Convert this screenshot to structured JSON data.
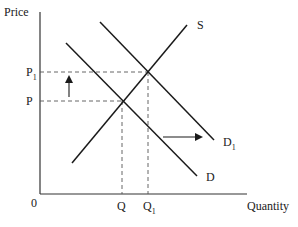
{
  "diagram": {
    "type": "supply-demand",
    "axes": {
      "y_label": "Price",
      "x_label": "Quantity",
      "origin_label": "0"
    },
    "price_levels": {
      "p": {
        "main": "P",
        "sub": ""
      },
      "p1": {
        "main": "P",
        "sub": "1"
      }
    },
    "quantity_levels": {
      "q": {
        "main": "Q",
        "sub": ""
      },
      "q1": {
        "main": "Q",
        "sub": "1"
      }
    },
    "curves": {
      "supply": {
        "main": "S",
        "sub": ""
      },
      "demand": {
        "main": "D",
        "sub": ""
      },
      "demand_shifted": {
        "main": "D",
        "sub": "1"
      }
    },
    "annotations": {
      "price_arrow": "up",
      "demand_shift_arrow": "right"
    },
    "colors": {
      "line": "#1a1a1a",
      "dashed": "#555555",
      "background": "#ffffff"
    }
  }
}
